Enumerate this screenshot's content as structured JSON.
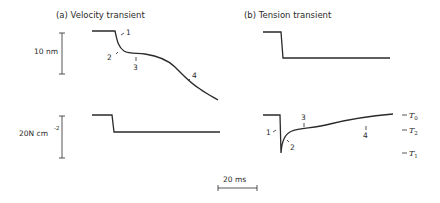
{
  "panel_a": {
    "title": "(a)  Velocity transient",
    "top_scale_label": "10 nm",
    "bottom_scale_label_main": "20N cm",
    "bottom_scale_label_exp": "-2",
    "markers": [
      "1",
      "2",
      "3",
      "4"
    ]
  },
  "panel_b": {
    "title": "(b)  Tension transient",
    "markers": [
      "1",
      "2",
      "3",
      "4"
    ],
    "levels": [
      {
        "name": "T",
        "sub": "0"
      },
      {
        "name": "T",
        "sub": "2"
      },
      {
        "name": "T",
        "sub": "1"
      }
    ]
  },
  "time_scale": {
    "label": "20 ms"
  }
}
